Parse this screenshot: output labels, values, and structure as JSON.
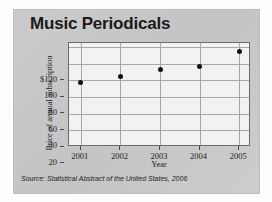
{
  "chart_data": {
    "type": "scatter",
    "title": "Music Periodicals",
    "xlabel": "Year",
    "ylabel": "Price of annual subscription",
    "categories": [
      "2001",
      "2002",
      "2003",
      "2004",
      "2005"
    ],
    "x": [
      2001,
      2002,
      2003,
      2004,
      2005
    ],
    "values": [
      77,
      85,
      93,
      97,
      115
    ],
    "xlim": [
      2000.7,
      2005.3
    ],
    "ylim": [
      0,
      125
    ],
    "ytick_labels": [
      "$120",
      "100",
      "80",
      "60",
      "40",
      "20"
    ],
    "ytick_values": [
      120,
      100,
      80,
      60,
      40,
      20
    ],
    "xtick_labels": [
      "2001",
      "2002",
      "2003",
      "2004",
      "2005"
    ],
    "grid": true,
    "legend": false,
    "source": "Source: Statistical Abstract of the United States, 2006",
    "marker": "filled-circle",
    "marker_color": "#111111",
    "plot_background": "#f2f2f2",
    "card_background": "#c9c9c9",
    "gridline_color": "#a8a8a8"
  }
}
